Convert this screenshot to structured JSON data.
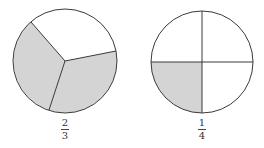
{
  "colors": {
    "shade": "#d4d4d4",
    "stroke": "#3a3a3a",
    "background": "#ffffff"
  },
  "figures": [
    {
      "name": "circle-thirds",
      "parts": 3,
      "shaded": 2,
      "fraction": {
        "numerator": "2",
        "denominator": "3"
      }
    },
    {
      "name": "circle-quarters",
      "parts": 4,
      "shaded": 1,
      "fraction": {
        "numerator": "1",
        "denominator": "4"
      }
    }
  ]
}
